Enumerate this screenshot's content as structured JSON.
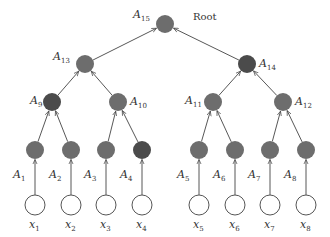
{
  "diagram": {
    "type": "binary-tree",
    "root_label": "Root",
    "colors": {
      "node": "#6d6d6d",
      "node_dark": "#4b4b4b",
      "leaf_fill": "#ffffff",
      "stroke": "#555555",
      "edge": "#444444"
    },
    "nodes": [
      {
        "id": "A15",
        "base": "A",
        "sub": "15",
        "x": 165,
        "y": 24,
        "dark": false,
        "label_side": "left"
      },
      {
        "id": "A13",
        "base": "A",
        "sub": "13",
        "x": 85,
        "y": 64,
        "dark": false,
        "label_side": "left"
      },
      {
        "id": "A14",
        "base": "A",
        "sub": "14",
        "x": 247,
        "y": 64,
        "dark": true,
        "label_side": "right"
      },
      {
        "id": "A9",
        "base": "A",
        "sub": "9",
        "x": 52,
        "y": 102,
        "dark": true,
        "label_side": "left"
      },
      {
        "id": "A10",
        "base": "A",
        "sub": "10",
        "x": 118,
        "y": 102,
        "dark": false,
        "label_side": "right"
      },
      {
        "id": "A11",
        "base": "A",
        "sub": "11",
        "x": 213,
        "y": 102,
        "dark": false,
        "label_side": "left"
      },
      {
        "id": "A12",
        "base": "A",
        "sub": "12",
        "x": 283,
        "y": 102,
        "dark": false,
        "label_side": "right"
      },
      {
        "id": "A1",
        "base": "A",
        "sub": "1",
        "x": 35,
        "y": 150,
        "dark": false,
        "label_side": "below-left"
      },
      {
        "id": "A2",
        "base": "A",
        "sub": "2",
        "x": 71,
        "y": 150,
        "dark": false,
        "label_side": "below-left"
      },
      {
        "id": "A3",
        "base": "A",
        "sub": "3",
        "x": 106,
        "y": 150,
        "dark": false,
        "label_side": "below-left"
      },
      {
        "id": "A4",
        "base": "A",
        "sub": "4",
        "x": 142,
        "y": 150,
        "dark": true,
        "label_side": "below-left"
      },
      {
        "id": "A5",
        "base": "A",
        "sub": "5",
        "x": 199,
        "y": 150,
        "dark": false,
        "label_side": "below-left"
      },
      {
        "id": "A6",
        "base": "A",
        "sub": "6",
        "x": 235,
        "y": 150,
        "dark": false,
        "label_side": "below-left"
      },
      {
        "id": "A7",
        "base": "A",
        "sub": "7",
        "x": 270,
        "y": 150,
        "dark": false,
        "label_side": "below-left"
      },
      {
        "id": "A8",
        "base": "A",
        "sub": "8",
        "x": 306,
        "y": 150,
        "dark": false,
        "label_side": "below-left"
      }
    ],
    "inputs": [
      {
        "id": "x1",
        "base": "x",
        "sub": "1",
        "x": 35,
        "y": 205
      },
      {
        "id": "x2",
        "base": "x",
        "sub": "2",
        "x": 71,
        "y": 205
      },
      {
        "id": "x3",
        "base": "x",
        "sub": "3",
        "x": 106,
        "y": 205
      },
      {
        "id": "x4",
        "base": "x",
        "sub": "4",
        "x": 142,
        "y": 205
      },
      {
        "id": "x5",
        "base": "x",
        "sub": "5",
        "x": 199,
        "y": 205
      },
      {
        "id": "x6",
        "base": "x",
        "sub": "6",
        "x": 235,
        "y": 205
      },
      {
        "id": "x7",
        "base": "x",
        "sub": "7",
        "x": 270,
        "y": 205
      },
      {
        "id": "x8",
        "base": "x",
        "sub": "8",
        "x": 306,
        "y": 205
      }
    ],
    "edges": [
      [
        "A13",
        "A15"
      ],
      [
        "A14",
        "A15"
      ],
      [
        "A9",
        "A13"
      ],
      [
        "A10",
        "A13"
      ],
      [
        "A11",
        "A14"
      ],
      [
        "A12",
        "A14"
      ],
      [
        "A1",
        "A9"
      ],
      [
        "A2",
        "A9"
      ],
      [
        "A3",
        "A10"
      ],
      [
        "A4",
        "A10"
      ],
      [
        "A5",
        "A11"
      ],
      [
        "A6",
        "A11"
      ],
      [
        "A7",
        "A12"
      ],
      [
        "A8",
        "A12"
      ],
      [
        "x1",
        "A1"
      ],
      [
        "x2",
        "A2"
      ],
      [
        "x3",
        "A3"
      ],
      [
        "x4",
        "A4"
      ],
      [
        "x5",
        "A5"
      ],
      [
        "x6",
        "A6"
      ],
      [
        "x7",
        "A7"
      ],
      [
        "x8",
        "A8"
      ]
    ]
  }
}
